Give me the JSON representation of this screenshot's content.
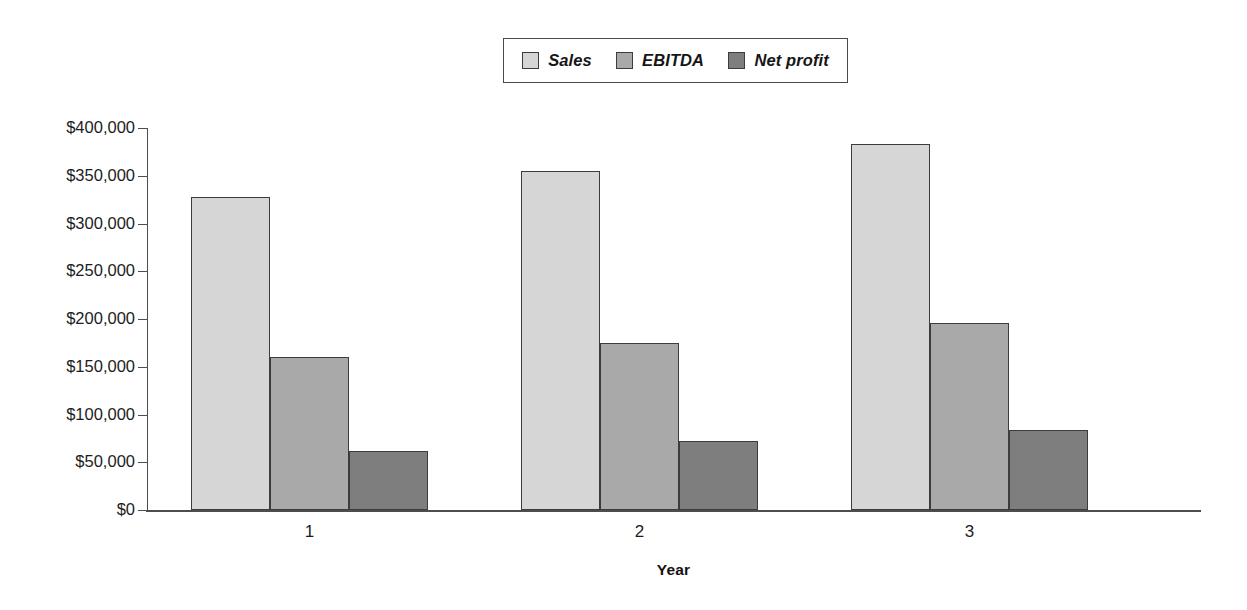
{
  "chart_data": {
    "type": "bar",
    "title": "",
    "subtitle": "",
    "xlabel": "Year",
    "ylabel": "",
    "categories": [
      "1",
      "2",
      "3"
    ],
    "series": [
      {
        "name": "Sales",
        "values": [
          328000,
          355000,
          383000
        ],
        "color": "#d6d6d6"
      },
      {
        "name": "EBITDA",
        "values": [
          160000,
          175000,
          196000
        ],
        "color": "#a9a9a9"
      },
      {
        "name": "Net profit",
        "values": [
          62000,
          72000,
          84000
        ],
        "color": "#7e7e7e"
      }
    ],
    "ylim": [
      0,
      400000
    ],
    "ytick_values": [
      0,
      50000,
      100000,
      150000,
      200000,
      250000,
      300000,
      350000,
      400000
    ],
    "ytick_labels": [
      "$0",
      "$50,000",
      "$100,000",
      "$150,000",
      "$200,000",
      "$250,000",
      "$300,000",
      "$350,000",
      "$400,000"
    ],
    "grid": false,
    "legend_position": "top-center",
    "bar_grouping": "grouped",
    "annotations": []
  },
  "legend": {
    "entries": [
      {
        "label": "Sales",
        "swatch": "legend-swatch-sales"
      },
      {
        "label": "EBITDA",
        "swatch": "legend-swatch-ebitda"
      },
      {
        "label": "Net profit",
        "swatch": "legend-swatch-net-profit"
      }
    ]
  },
  "axes": {
    "x": {
      "title": "Year",
      "tick_labels": [
        "1",
        "2",
        "3"
      ]
    },
    "y": {
      "tick_labels": [
        "$400,000",
        "$350,000",
        "$300,000",
        "$250,000",
        "$200,000",
        "$150,000",
        "$100,000",
        "$50,000",
        "$0"
      ]
    }
  }
}
